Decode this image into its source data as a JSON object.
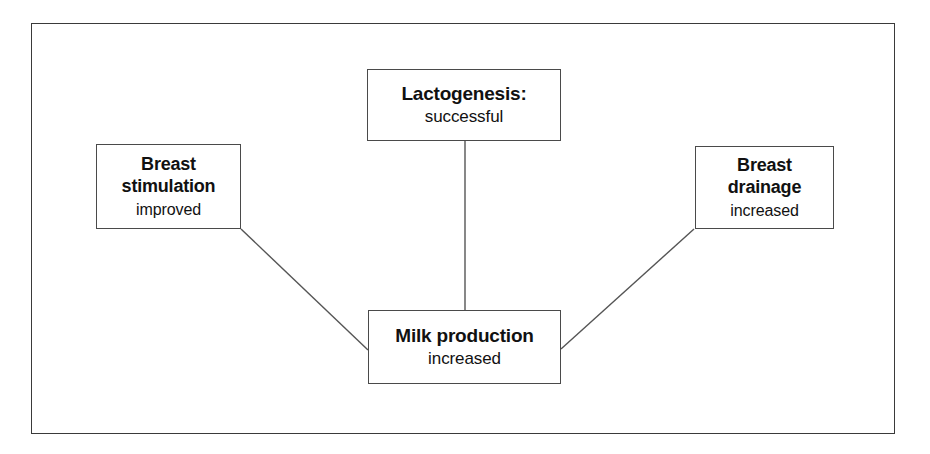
{
  "figure": {
    "type": "flow-diagram",
    "background_color": "#ffffff",
    "frame_color": "#3a3a3a",
    "node_border_color": "#4a4a4a",
    "connector_color": "#555555",
    "text_color": "#111111"
  },
  "nodes": [
    {
      "id": "lactogenesis",
      "title": "Lactogenesis:",
      "state": "successful"
    },
    {
      "id": "breast_stimulation",
      "title": "Breast\nstimulation",
      "state": "improved"
    },
    {
      "id": "breast_drainage",
      "title": "Breast\ndrainage",
      "state": "increased"
    },
    {
      "id": "milk_production",
      "title": "Milk production",
      "state": "increased"
    }
  ],
  "connectors": [
    {
      "id": "lactogenesis-to-milk-production",
      "from": "lactogenesis",
      "to": "milk_production",
      "style": "straight-vertical"
    },
    {
      "id": "breast-stimulation-to-milk-production",
      "from": "breast_stimulation",
      "to": "milk_production",
      "style": "diagonal"
    },
    {
      "id": "breast-drainage-to-milk-production",
      "from": "breast_drainage",
      "to": "milk_production",
      "style": "diagonal"
    }
  ]
}
